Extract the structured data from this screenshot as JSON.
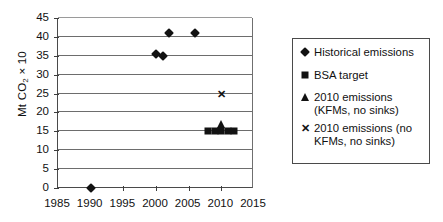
{
  "chart_data": {
    "type": "scatter",
    "title": "",
    "xlabel": "",
    "ylabel": "Mt CO2 x 10",
    "ylabel_parts": {
      "prefix": "Mt CO",
      "sub": "2",
      "suffix": " × 10"
    },
    "xlim": [
      1985,
      2015
    ],
    "ylim": [
      0,
      45
    ],
    "xticks": [
      1985,
      1990,
      1995,
      2000,
      2005,
      2010,
      2015
    ],
    "yticks": [
      0,
      5,
      10,
      15,
      20,
      25,
      30,
      35,
      40,
      45
    ],
    "grid": "horizontal",
    "legend_position": "right",
    "series": [
      {
        "name": "Historical emissions",
        "marker": "diamond",
        "color": "#121212",
        "points": [
          {
            "x": 1990,
            "y": 0
          },
          {
            "x": 2000,
            "y": 35.5
          },
          {
            "x": 2001,
            "y": 35
          },
          {
            "x": 2002,
            "y": 41
          },
          {
            "x": 2006,
            "y": 41
          }
        ]
      },
      {
        "name": "BSA target",
        "marker": "square",
        "color": "#121212",
        "points": [
          {
            "x": 2008,
            "y": 15
          },
          {
            "x": 2009,
            "y": 15
          },
          {
            "x": 2010,
            "y": 15
          },
          {
            "x": 2011,
            "y": 15
          },
          {
            "x": 2012,
            "y": 15
          }
        ]
      },
      {
        "name": "2010 emissions (KFMs, no sinks)",
        "marker": "triangle",
        "color": "#121212",
        "points": [
          {
            "x": 2010,
            "y": 17
          }
        ]
      },
      {
        "name": "2010 emissions (no KFMs, no sinks)",
        "marker": "cross",
        "color": "#121212",
        "points": [
          {
            "x": 2010,
            "y": 25
          }
        ]
      }
    ]
  },
  "legend": {
    "items": [
      {
        "label": "Historical emissions",
        "marker": "diamond"
      },
      {
        "label": "BSA target",
        "marker": "square"
      },
      {
        "label": "2010 emissions (KFMs, no sinks)",
        "marker": "triangle"
      },
      {
        "label": "2010 emissions (no KFMs, no sinks)",
        "marker": "cross"
      }
    ]
  }
}
